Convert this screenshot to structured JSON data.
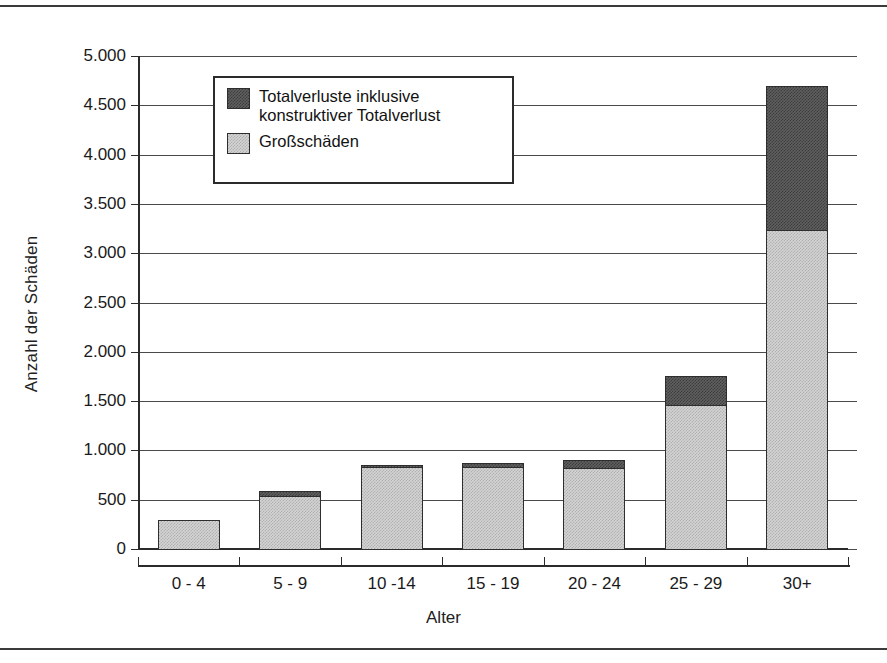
{
  "chart_data": {
    "type": "bar",
    "stacked": true,
    "title": "",
    "xlabel": "Alter",
    "ylabel": "Anzahl der Schäden",
    "categories": [
      "0 - 4",
      "5 - 9",
      "10 -14",
      "15 - 19",
      "20 - 24",
      "25 - 29",
      "30+"
    ],
    "series": [
      {
        "name": "Großschäden",
        "color": "#d4d4d4",
        "values": [
          300,
          545,
          840,
          845,
          835,
          1475,
          3250
        ]
      },
      {
        "name": "Totalverluste inklusive konstruktiver Totalverlust",
        "color": "#5f5f5f",
        "values": [
          0,
          65,
          30,
          45,
          85,
          300,
          1470
        ]
      }
    ],
    "totals": [
      300,
      610,
      870,
      890,
      920,
      1775,
      4720
    ],
    "ylim": [
      0,
      5000
    ],
    "ytick_step": 500,
    "ytick_labels": [
      "0",
      "500",
      "1.000",
      "1.500",
      "2.000",
      "2.500",
      "3.000",
      "3.500",
      "4.000",
      "4.500",
      "5.000"
    ],
    "ytick_values": [
      0,
      500,
      1000,
      1500,
      2000,
      2500,
      3000,
      3500,
      4000,
      4500,
      5000
    ],
    "grid": true,
    "legend_position": "upper-left-inside"
  },
  "axes": {
    "y_title": "Anzahl der Schäden",
    "x_title": "Alter"
  },
  "legend": {
    "entries": [
      {
        "label": "Totalverluste inklusive\nkonstruktiver Totalverlust",
        "swatch": "dark"
      },
      {
        "label": "Großschäden",
        "swatch": "light"
      }
    ]
  }
}
